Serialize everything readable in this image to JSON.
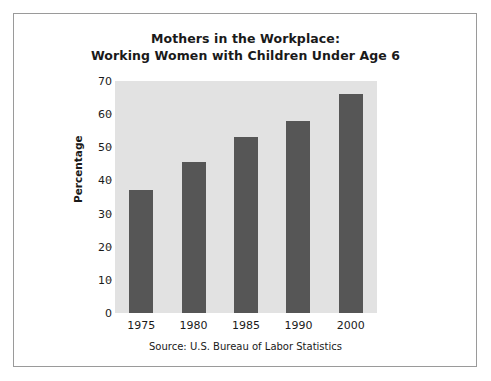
{
  "chart_data": {
    "type": "bar",
    "title": "Mothers in the Workplace:\nWorking Women with Children Under Age 6",
    "title_line1": "Mothers in the Workplace:",
    "title_line2": "Working Women with Children Under Age 6",
    "categories": [
      "1975",
      "1980",
      "1985",
      "1990",
      "2000"
    ],
    "values": [
      37,
      45.5,
      53,
      58,
      66
    ],
    "xlabel": "",
    "ylabel": "Percentage",
    "ylim": [
      0,
      70
    ],
    "yticks": [
      0,
      10,
      20,
      30,
      40,
      50,
      60,
      70
    ],
    "ytick_labels": [
      "0",
      "10",
      "20",
      "30",
      "40",
      "50",
      "60",
      "70"
    ],
    "grid": false,
    "legend": null,
    "source_note": "Source: U.S. Bureau of Labor Statistics",
    "colors": {
      "bar": "#565656",
      "plot_background": "#e2e2e2",
      "figure_background": "#ffffff",
      "frame_border": "#9a9a9a",
      "text": "#1a1a1a"
    }
  }
}
